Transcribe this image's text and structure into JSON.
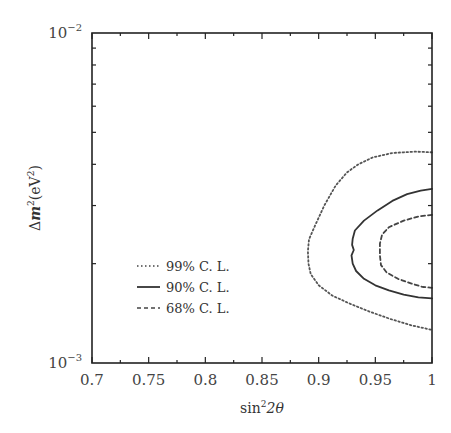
{
  "chart_data": {
    "type": "line",
    "title": "",
    "xlabel": "sin²2θ",
    "xlabel_parts": {
      "base": "sin",
      "sup": "2",
      "rest": "2θ"
    },
    "ylabel": "Δm²(eV²)",
    "ylabel_parts": {
      "delta": "Δ",
      "m": "m",
      "sup1": "2",
      "open": "(eV",
      "sup2": "2",
      "close": ")"
    },
    "xlim": [
      0.7,
      1.0
    ],
    "ylim": [
      0.001,
      0.01
    ],
    "yscale": "log",
    "x_ticks": [
      0.7,
      0.75,
      0.8,
      0.85,
      0.9,
      0.95,
      1.0
    ],
    "x_tick_labels": [
      "0.7",
      "0.75",
      "0.8",
      "0.85",
      "0.9",
      "0.95",
      "1"
    ],
    "y_tick_labels": [
      {
        "value": 0.01,
        "base": "10",
        "exp": "−2"
      },
      {
        "value": 0.001,
        "base": "10",
        "exp": "−3"
      }
    ],
    "grid": false,
    "legend_position": "lower-left",
    "series": [
      {
        "name": "99% C. L.",
        "style": "dotted",
        "points": [
          [
            1.0,
            0.00435
          ],
          [
            0.985,
            0.00437
          ],
          [
            0.965,
            0.00433
          ],
          [
            0.948,
            0.0042
          ],
          [
            0.935,
            0.004
          ],
          [
            0.925,
            0.00378
          ],
          [
            0.915,
            0.00345
          ],
          [
            0.905,
            0.003
          ],
          [
            0.897,
            0.00262
          ],
          [
            0.8915,
            0.00237
          ],
          [
            0.8905,
            0.00218
          ],
          [
            0.891,
            0.002
          ],
          [
            0.893,
            0.00186
          ],
          [
            0.9,
            0.00172
          ],
          [
            0.912,
            0.0016
          ],
          [
            0.928,
            0.00151
          ],
          [
            0.945,
            0.00143
          ],
          [
            0.963,
            0.00136
          ],
          [
            0.982,
            0.0013
          ],
          [
            1.0,
            0.00126
          ]
        ]
      },
      {
        "name": "90% C. L.",
        "style": "solid",
        "points": [
          [
            1.0,
            0.00337
          ],
          [
            0.99,
            0.00333
          ],
          [
            0.978,
            0.00325
          ],
          [
            0.965,
            0.0031
          ],
          [
            0.952,
            0.0029
          ],
          [
            0.94,
            0.0027
          ],
          [
            0.932,
            0.00252
          ],
          [
            0.93,
            0.00238
          ],
          [
            0.9295,
            0.00228
          ],
          [
            0.931,
            0.0022
          ],
          [
            0.929,
            0.00212
          ],
          [
            0.93,
            0.002
          ],
          [
            0.933,
            0.0019
          ],
          [
            0.94,
            0.0018
          ],
          [
            0.95,
            0.00172
          ],
          [
            0.962,
            0.00166
          ],
          [
            0.975,
            0.00161
          ],
          [
            0.988,
            0.00158
          ],
          [
            1.0,
            0.00157
          ]
        ]
      },
      {
        "name": "68% C. L.",
        "style": "dashed",
        "points": [
          [
            1.0,
            0.00281
          ],
          [
            0.988,
            0.00278
          ],
          [
            0.975,
            0.0027
          ],
          [
            0.962,
            0.00258
          ],
          [
            0.956,
            0.00245
          ],
          [
            0.954,
            0.0023
          ],
          [
            0.954,
            0.00212
          ],
          [
            0.955,
            0.00198
          ],
          [
            0.96,
            0.00188
          ],
          [
            0.97,
            0.0018
          ],
          [
            0.982,
            0.00174
          ],
          [
            0.992,
            0.0017
          ],
          [
            1.0,
            0.00169
          ]
        ]
      }
    ]
  }
}
